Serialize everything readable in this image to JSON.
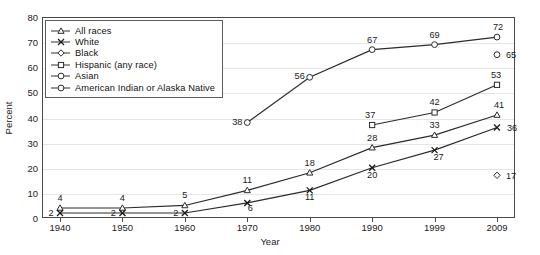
{
  "chart_data": {
    "type": "line",
    "title": "",
    "xlabel": "Year",
    "ylabel": "Percent",
    "categories": [
      "1940",
      "1950",
      "1960",
      "1970",
      "1980",
      "1990",
      "1999",
      "2009"
    ],
    "ylim": [
      0,
      80
    ],
    "yticks": [
      "0",
      "10",
      "20",
      "30",
      "40",
      "50",
      "60",
      "70",
      "80"
    ],
    "grid": true,
    "legend_position": "upper-left",
    "series": [
      {
        "name": "All races",
        "marker": "triangle",
        "values": [
          4,
          4,
          5,
          11,
          18,
          28,
          33,
          41
        ],
        "labels": [
          "4",
          "4",
          "5",
          "11",
          "18",
          "28",
          "33",
          "41"
        ]
      },
      {
        "name": "White",
        "marker": "x",
        "values": [
          2,
          2,
          2,
          6,
          11,
          20,
          27,
          36
        ],
        "labels": [
          "2",
          "2",
          "2",
          "6",
          "11",
          "20",
          "27",
          "36"
        ]
      },
      {
        "name": "Black",
        "marker": "diamond",
        "values": [
          null,
          null,
          null,
          null,
          null,
          null,
          null,
          17
        ],
        "labels": [
          "",
          "",
          "",
          "",
          "",
          "",
          "",
          "17"
        ]
      },
      {
        "name": "Hispanic (any race)",
        "marker": "square",
        "values": [
          null,
          null,
          null,
          null,
          null,
          37,
          42,
          53
        ],
        "labels": [
          "",
          "",
          "",
          "",
          "",
          "37",
          "42",
          "53"
        ]
      },
      {
        "name": "Asian",
        "marker": "circle",
        "values": [
          null,
          null,
          null,
          38,
          56,
          67,
          69,
          72
        ],
        "labels": [
          "",
          "",
          "",
          "38",
          "56",
          "67",
          "69",
          "72"
        ]
      },
      {
        "name": "American Indian or Alaska Native",
        "marker": "circle",
        "values": [
          null,
          null,
          null,
          null,
          null,
          null,
          null,
          65
        ],
        "labels": [
          "",
          "",
          "",
          "",
          "",
          "",
          "",
          "65"
        ]
      }
    ]
  },
  "legend": {
    "items": [
      {
        "label": "All races",
        "marker": "triangle",
        "has_line": true
      },
      {
        "label": "White",
        "marker": "x",
        "has_line": true
      },
      {
        "label": "Black",
        "marker": "diamond",
        "has_line": true
      },
      {
        "label": "Hispanic (any race)",
        "marker": "square",
        "has_line": true
      },
      {
        "label": "Asian",
        "marker": "circle",
        "has_line": true
      },
      {
        "label": "American Indian or Alaska Native",
        "marker": "circle",
        "has_line": true
      }
    ]
  },
  "axes": {
    "y_label": "Percent",
    "x_label": "Year",
    "y_ticks": [
      "80",
      "70",
      "60",
      "50",
      "40",
      "30",
      "20",
      "10",
      "0"
    ],
    "x_ticks": [
      "1940",
      "1950",
      "1960",
      "1970",
      "1980",
      "1990",
      "1999",
      "2009"
    ]
  },
  "colors": {
    "line": "#2b2b2b",
    "grid": "#e6e6e6",
    "frame": "#4a4a4a",
    "text": "#1a1a1a",
    "background": "#ffffff"
  }
}
